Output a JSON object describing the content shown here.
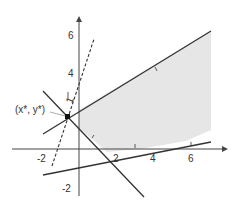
{
  "diagram": {
    "type": "linear-program-feasible-region",
    "axes": {
      "x_ticks": [
        "-2",
        "2",
        "4",
        "6"
      ],
      "y_ticks": [
        "6",
        "4",
        "-2"
      ],
      "x_range": [
        -3.5,
        7.5
      ],
      "y_range": [
        -2.8,
        7.2
      ]
    },
    "point_label": "(x*, y*)",
    "gradient_label": "1",
    "colors": {
      "region_fill": "#e8e8e8",
      "line": "#333333",
      "axis": "#444444"
    }
  }
}
